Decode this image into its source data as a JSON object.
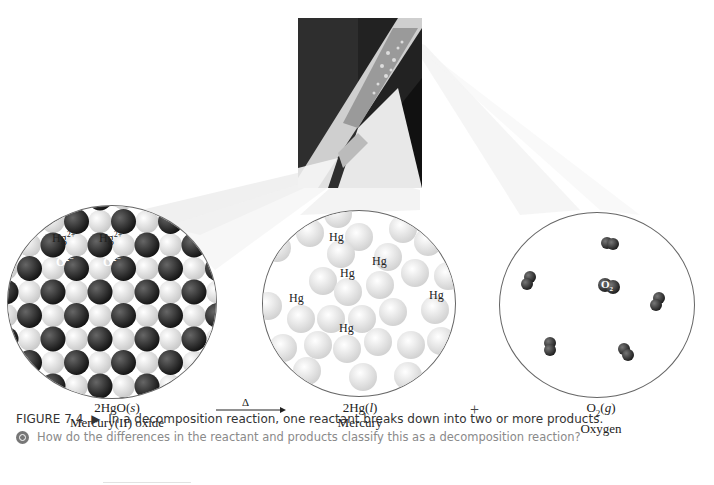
{
  "figure": {
    "number": "FIGURE 7.4",
    "marker": "▶",
    "caption": "In a decomposition reaction, one reactant breaks down into two or more products.",
    "question": "How do the differences in the reactant and products classify this as a decomposition reaction?",
    "question_icon": "question-target-icon"
  },
  "photo": {
    "description": "Test tube of mercury(II) oxide being heated, releasing oxygen gas and forming mercury droplets"
  },
  "reactant": {
    "formula": "2HgO(s)",
    "formula_parts": {
      "coef": "2HgO",
      "state": "s"
    },
    "name": "Mercury(II) oxide",
    "name_parts": {
      "pre": "Mercury",
      "ox": "(II)",
      "post": " oxide"
    },
    "labels": {
      "hg_ion": "Hg",
      "hg_charge": "2+",
      "o_ion": "O",
      "o_charge": "2−"
    }
  },
  "arrow": {
    "symbol": "Δ"
  },
  "product1": {
    "formula_parts": {
      "coef": "2Hg",
      "state": "l"
    },
    "name": "Mercury",
    "atom_label": "Hg"
  },
  "plus": "+",
  "product2": {
    "formula_parts": {
      "base": "O",
      "sub": "2",
      "state": "g"
    },
    "name": "Oxygen",
    "molecule_label": "O",
    "molecule_sub": "2"
  },
  "colors": {
    "oxide_ion": "#2b2b2b",
    "mercury_atom": "#e6e6e6",
    "caption_text": "#333333",
    "question_text": "#8a8a8a"
  }
}
